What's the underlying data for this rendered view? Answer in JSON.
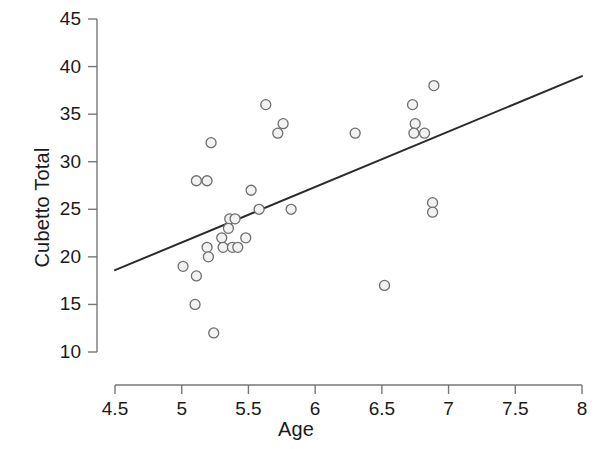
{
  "chart_data": {
    "type": "scatter",
    "title": "",
    "xlabel": "Age",
    "ylabel": "Cubetto Total",
    "xlim": [
      4.5,
      8.0
    ],
    "ylim": [
      10,
      45
    ],
    "xticks": [
      "4.5",
      "5",
      "5.5",
      "6",
      "6.5",
      "7",
      "7.5",
      "8"
    ],
    "xtick_values": [
      4.5,
      5,
      5.5,
      6,
      6.5,
      7,
      7.5,
      8
    ],
    "yticks": [
      "10",
      "15",
      "20",
      "25",
      "30",
      "35",
      "40",
      "45"
    ],
    "ytick_values": [
      10,
      15,
      20,
      25,
      30,
      35,
      40,
      45
    ],
    "grid": false,
    "legend": null,
    "marker": {
      "shape": "circle-open",
      "edge_color": "#6e6e6e",
      "fill_color": "#f2f2f2",
      "radius_px": 5
    },
    "points": [
      {
        "x": 5.01,
        "y": 19
      },
      {
        "x": 5.11,
        "y": 28
      },
      {
        "x": 5.19,
        "y": 28
      },
      {
        "x": 5.11,
        "y": 18
      },
      {
        "x": 5.1,
        "y": 15
      },
      {
        "x": 5.19,
        "y": 21
      },
      {
        "x": 5.2,
        "y": 20
      },
      {
        "x": 5.22,
        "y": 32
      },
      {
        "x": 5.24,
        "y": 12
      },
      {
        "x": 5.3,
        "y": 22
      },
      {
        "x": 5.31,
        "y": 21
      },
      {
        "x": 5.38,
        "y": 21
      },
      {
        "x": 5.42,
        "y": 21
      },
      {
        "x": 5.36,
        "y": 24
      },
      {
        "x": 5.4,
        "y": 24
      },
      {
        "x": 5.35,
        "y": 23
      },
      {
        "x": 5.48,
        "y": 22
      },
      {
        "x": 5.52,
        "y": 27
      },
      {
        "x": 5.63,
        "y": 36
      },
      {
        "x": 5.58,
        "y": 25
      },
      {
        "x": 5.72,
        "y": 33
      },
      {
        "x": 5.76,
        "y": 34
      },
      {
        "x": 5.82,
        "y": 25
      },
      {
        "x": 6.3,
        "y": 33
      },
      {
        "x": 6.52,
        "y": 17
      },
      {
        "x": 6.73,
        "y": 36
      },
      {
        "x": 6.75,
        "y": 34
      },
      {
        "x": 6.74,
        "y": 33
      },
      {
        "x": 6.82,
        "y": 33
      },
      {
        "x": 6.89,
        "y": 38
      },
      {
        "x": 6.88,
        "y": 25.7
      },
      {
        "x": 6.88,
        "y": 24.7
      }
    ],
    "trendline": {
      "type": "linear-fit",
      "x_start": 4.5,
      "y_start": 18.6,
      "x_end": 8.0,
      "y_end": 39.0,
      "color": "#2b2b2b",
      "width_px": 2
    }
  },
  "axis_style": {
    "axis_color": "#777777",
    "tick_color": "#777777",
    "text_color": "#1a1a1a",
    "background": "#ffffff"
  }
}
